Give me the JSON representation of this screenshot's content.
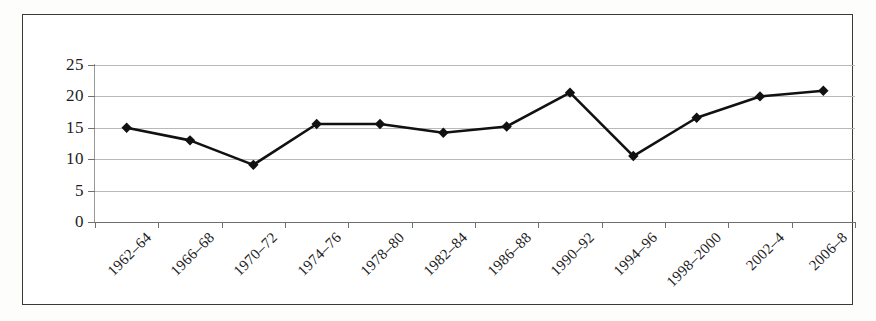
{
  "chart_data": {
    "type": "line",
    "title": "",
    "subtitle": "",
    "xlabel": "",
    "ylabel": "",
    "categories": [
      "1962–64",
      "1966–68",
      "1970–72",
      "1974–76",
      "1978–80",
      "1982–84",
      "1986–88",
      "1990–92",
      "1994–96",
      "1998–2000",
      "2002–4",
      "2006–8"
    ],
    "values": [
      15.0,
      13.0,
      9.1,
      15.6,
      15.6,
      14.2,
      15.2,
      20.6,
      10.5,
      16.6,
      20.0,
      20.9
    ],
    "series": [
      {
        "name": "series-1",
        "values": [
          15.0,
          13.0,
          9.1,
          15.6,
          15.6,
          14.2,
          15.2,
          20.6,
          10.5,
          16.6,
          20.0,
          20.9
        ]
      }
    ],
    "ylim": [
      0,
      25
    ],
    "yticks": [
      0,
      5,
      10,
      15,
      20,
      25
    ],
    "ytick_labels": [
      "0",
      "5",
      "10",
      "15",
      "20",
      "25"
    ],
    "grid": true,
    "grid_axis": "y",
    "legend": false,
    "legend_position": "none",
    "marker": "diamond",
    "xtick_label_rotation": -45,
    "colors": {
      "line": "#111111",
      "marker": "#111111",
      "gridline": "#b9b9b9",
      "axis": "#6f6f6f",
      "frame": "#3a3a3a",
      "text": "#1d1d1d",
      "background": "#ffffff"
    }
  }
}
